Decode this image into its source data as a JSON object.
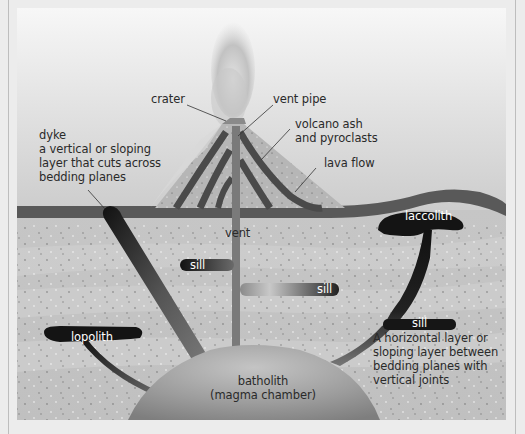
{
  "diagram": {
    "type": "volcano cross-section / igneous intrusions",
    "labels": {
      "crater": "crater",
      "vent_pipe": "vent pipe",
      "ash": "volcano ash\nand pyroclasts",
      "lava_flow": "lava flow",
      "dyke_title": "dyke",
      "dyke_desc": "a vertical or sloping\nlayer that cuts across\nbedding planes",
      "vent": "vent",
      "sill_1": "sill",
      "sill_2": "sill",
      "sill_3": "sill",
      "laccolith": "laccolith",
      "lopolith": "lopolith",
      "sill_desc": "A horizontal layer or\nsloping layer between\nbedding planes with\nvertical joints",
      "batholith": "batholith\n(magma chamber)"
    },
    "colors": {
      "sky_top": "#f4f4f4",
      "sky_bottom": "#cfcfcf",
      "surface_band": "#5a5a5a",
      "rock_light": "#c9c9c9",
      "rock_dark": "#bdbdbd",
      "intrusion": "#1a1a1a",
      "vent": "#7a7a7a",
      "cone": "#b3b3b3"
    }
  }
}
